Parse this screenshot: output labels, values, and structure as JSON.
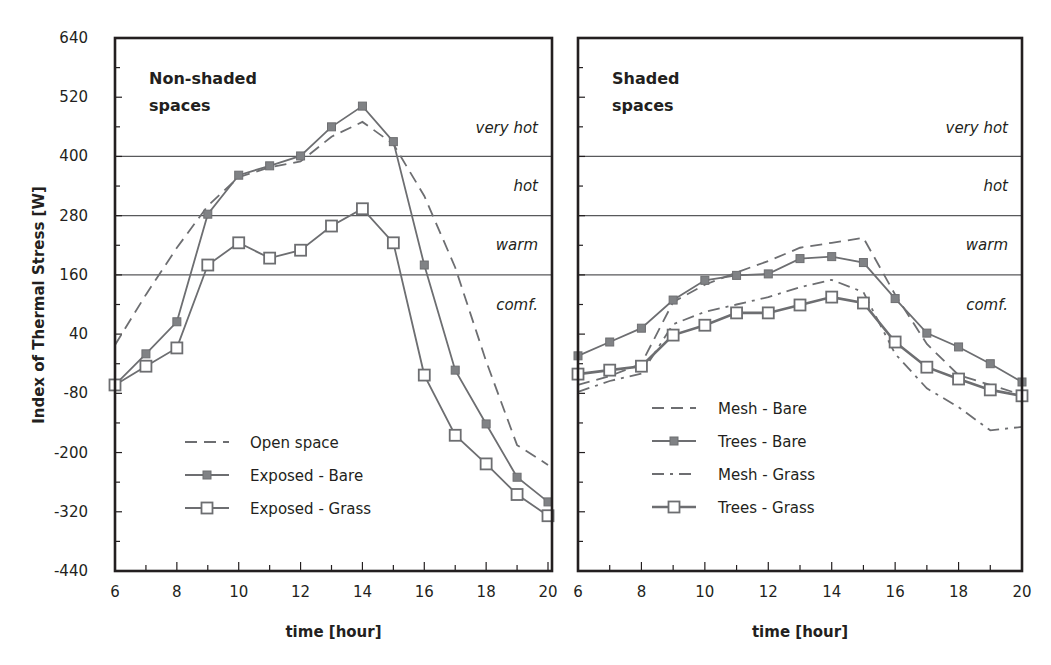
{
  "chart_data": [
    {
      "type": "line",
      "panel": "left",
      "title": "Non-shaded spaces",
      "title_lines": [
        "Non-shaded",
        "spaces"
      ],
      "xlabel": "time [hour]",
      "ylabel": "Index of Thermal Stress  [W]",
      "xlim": [
        6,
        20
      ],
      "ylim": [
        -440,
        640
      ],
      "x_ticks": [
        6,
        8,
        10,
        12,
        14,
        16,
        18,
        20
      ],
      "y_ticks": [
        640,
        520,
        400,
        280,
        160,
        40,
        -80,
        -200,
        -320,
        -440
      ],
      "thresholds": [
        400,
        280,
        160
      ],
      "zones": [
        {
          "label": "very hot",
          "value": 460
        },
        {
          "label": "hot",
          "value": 342
        },
        {
          "label": "warm",
          "value": 222
        },
        {
          "label": "comf.",
          "value": 102
        }
      ],
      "x": [
        6,
        7,
        8,
        9,
        10,
        11,
        12,
        13,
        14,
        15,
        16,
        17,
        18,
        19,
        20
      ],
      "series": [
        {
          "name": "Open space",
          "style": "dashed",
          "marker": "none",
          "values": [
            18,
            120,
            215,
            300,
            358,
            378,
            390,
            440,
            470,
            425,
            320,
            175,
            -15,
            -185,
            -225
          ]
        },
        {
          "name": "Exposed - Bare",
          "style": "solid",
          "marker": "filled-square",
          "values": [
            -63,
            0,
            65,
            283,
            362,
            381,
            401,
            460,
            502,
            430,
            180,
            -33,
            -142,
            -250,
            -300
          ]
        },
        {
          "name": "Exposed - Grass",
          "style": "solid",
          "marker": "open-square",
          "values": [
            -63,
            -25,
            12,
            180,
            225,
            194,
            210,
            259,
            294,
            225,
            -43,
            -165,
            -223,
            -285,
            -328
          ]
        }
      ],
      "legend_position": "lower-left",
      "grid": false
    },
    {
      "type": "line",
      "panel": "right",
      "title": "Shaded spaces",
      "title_lines": [
        "Shaded",
        "spaces"
      ],
      "xlabel": "time [hour]",
      "ylabel": "",
      "xlim": [
        6,
        20
      ],
      "ylim": [
        -440,
        640
      ],
      "x_ticks": [
        6,
        8,
        10,
        12,
        14,
        16,
        18,
        20
      ],
      "thresholds": [
        400,
        280,
        160
      ],
      "zones": [
        {
          "label": "very hot",
          "value": 460
        },
        {
          "label": "hot",
          "value": 342
        },
        {
          "label": "warm",
          "value": 222
        },
        {
          "label": "comf.",
          "value": 102
        }
      ],
      "x": [
        6,
        7,
        8,
        9,
        10,
        11,
        12,
        13,
        14,
        15,
        16,
        17,
        18,
        19,
        20
      ],
      "series": [
        {
          "name": "Mesh - Bare",
          "style": "dashed",
          "marker": "none",
          "values": [
            -63,
            -45,
            -20,
            105,
            140,
            165,
            188,
            215,
            225,
            235,
            120,
            20,
            -43,
            -63,
            -83
          ]
        },
        {
          "name": "Trees - Bare",
          "style": "solid",
          "marker": "filled-square",
          "values": [
            -4,
            24,
            52,
            109,
            149,
            159,
            162,
            193,
            197,
            185,
            112,
            42,
            14,
            -20,
            -57
          ]
        },
        {
          "name": "Mesh - Grass",
          "style": "dashdot",
          "marker": "none",
          "values": [
            -77,
            -55,
            -40,
            60,
            85,
            100,
            115,
            135,
            150,
            125,
            0,
            -70,
            -108,
            -155,
            -148
          ]
        },
        {
          "name": "Trees - Grass",
          "style": "solid-thick",
          "marker": "open-square",
          "values": [
            -41,
            -33,
            -25,
            38,
            58,
            83,
            83,
            99,
            115,
            103,
            24,
            -27,
            -51,
            -73,
            -85
          ]
        }
      ],
      "legend_position": "lower-center",
      "grid": false
    }
  ],
  "colors": {
    "frame": "#231f20",
    "series_line": "#6d6e71",
    "marker_fill": "#808285",
    "threshold_line": "#58595b"
  }
}
